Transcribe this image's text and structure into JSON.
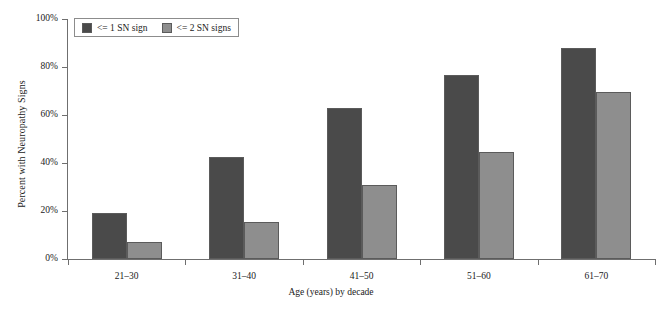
{
  "chart_data": {
    "type": "bar",
    "title": "",
    "xlabel": "Age (years) by decade",
    "ylabel": "Percent with Neuropathy Signs",
    "categories": [
      "21–30",
      "31–40",
      "41–50",
      "51–60",
      "61–70"
    ],
    "series": [
      {
        "name": "<= 1 SN sign",
        "color": "#4a4a4a",
        "values": [
          19,
          42.5,
          63,
          76.5,
          88
        ]
      },
      {
        "name": "<= 2 SN signs",
        "color": "#8e8e8e",
        "values": [
          7,
          15.5,
          31,
          44.5,
          69.5
        ]
      }
    ],
    "ylim": [
      0,
      100
    ],
    "ytick_labels": [
      "0%",
      "20%",
      "40%",
      "60%",
      "80%",
      "100%"
    ],
    "ytick_values": [
      0,
      20,
      40,
      60,
      80,
      100
    ],
    "grid": false,
    "legend_position": "top-left"
  },
  "axis_colors": {
    "axis_line": "#6f6f6f",
    "bar_outline": "#5b5b5b",
    "background": "#ffffff",
    "text": "#1a1a1a"
  }
}
